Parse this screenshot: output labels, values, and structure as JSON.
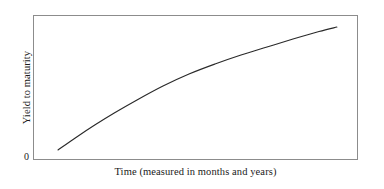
{
  "figure": {
    "background_color": "#ffffff",
    "frame_color": "#8c8c8c",
    "curve_color": "#2a2a2a"
  },
  "axes": {
    "origin_label": "0",
    "x_label": "Time (measured in months and years)",
    "y_label": "Yield to maturity"
  },
  "chart_data": {
    "type": "line",
    "title": "",
    "subtitle": "",
    "xlabel": "Time (measured in months and years)",
    "ylabel": "Yield to maturity",
    "annotations": [
      "0"
    ],
    "grid": false,
    "legend": null,
    "axis_ticks": {
      "x": [],
      "y": []
    },
    "xlim": [
      0,
      1
    ],
    "ylim": [
      0,
      1
    ],
    "series": [
      {
        "name": "Upward-sloping yield curve",
        "shape": "concave-down increasing",
        "x": [
          0.077,
          0.13,
          0.19,
          0.25,
          0.32,
          0.4,
          0.48,
          0.56,
          0.64,
          0.72,
          0.8,
          0.88,
          0.935
        ],
        "y": [
          0.069,
          0.152,
          0.241,
          0.324,
          0.414,
          0.51,
          0.593,
          0.662,
          0.724,
          0.779,
          0.834,
          0.886,
          0.917
        ]
      }
    ]
  }
}
